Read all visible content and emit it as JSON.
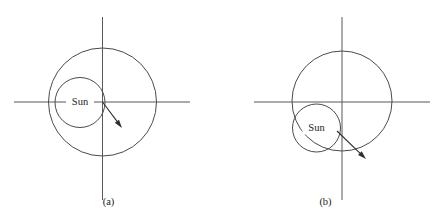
{
  "figure": {
    "background_color": "#ffffff",
    "line_color": "#4a4a4a",
    "axis_color": "#585858",
    "arrow_color": "#2e2e2e",
    "text_color": "#1a1a1a",
    "width": 434,
    "height": 223
  },
  "panels": [
    {
      "id": "a",
      "caption": "(a)",
      "sun_label": "Sun",
      "axes": {
        "origin_x": 102.5,
        "origin_y": 102,
        "horizontal_x1": 14,
        "horizontal_x2": 190,
        "vertical_y1": 17,
        "vertical_y2": 200
      },
      "orbit_circle": {
        "cx": 102.5,
        "cy": 102,
        "r": 54
      },
      "sun_circle": {
        "cx": 80,
        "cy": 102.5,
        "r": 25
      },
      "arrow": {
        "x1": 102.5,
        "y1": 102,
        "x2": 122,
        "y2": 128
      }
    },
    {
      "id": "b",
      "caption": "(b)",
      "sun_label": "Sun",
      "axes": {
        "origin_x": 342,
        "origin_y": 102,
        "horizontal_x1": 254,
        "horizontal_x2": 430,
        "vertical_y1": 17,
        "vertical_y2": 200
      },
      "orbit_circle": {
        "cx": 342,
        "cy": 101,
        "r": 50
      },
      "sun_circle": {
        "cx": 316.5,
        "cy": 128,
        "r": 24
      },
      "arrow": {
        "x1": 337,
        "y1": 131,
        "x2": 366,
        "y2": 159
      }
    }
  ]
}
